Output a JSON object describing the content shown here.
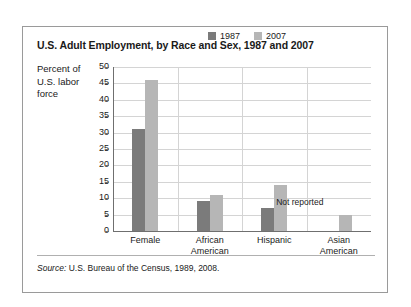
{
  "figure": {
    "title": "U.S. Adult Employment, by Race and Sex, 1987 and 2007",
    "axis_title": "Percent of U.S. labor force",
    "source_label": "Source:",
    "source_text": " U.S. Bureau of the Census, 1989, 2008.",
    "not_reported_label": "Not reported",
    "colors": {
      "series_1987": "#7b7b7b",
      "series_2007": "#b6b6b6",
      "frame_border": "#9a9a9a",
      "gridline": "#d4d4d4",
      "axis": "#6f6f6f",
      "background": "#ffffff"
    }
  },
  "chart_data": {
    "type": "bar",
    "title": "U.S. Adult Employment, by Race and Sex, 1987 and 2007",
    "subtitle": "",
    "xlabel": "",
    "ylabel": "Percent of U.S. labor force",
    "ylim": [
      0,
      50
    ],
    "yticks": [
      0,
      5,
      10,
      15,
      20,
      25,
      30,
      35,
      40,
      45,
      50
    ],
    "ytick_labels": [
      "0",
      "5",
      "10",
      "15",
      "20",
      "25",
      "30",
      "35",
      "40",
      "45",
      "50"
    ],
    "grid": "horizontal",
    "legend_position": "top-center",
    "categories": [
      "Female",
      "African American",
      "Hispanic",
      "Asian American"
    ],
    "category_lines": [
      [
        "Female"
      ],
      [
        "African",
        "American"
      ],
      [
        "Hispanic"
      ],
      [
        "Asian",
        "American"
      ]
    ],
    "series": [
      {
        "name": "1987",
        "color": "#7b7b7b",
        "values": [
          31,
          9,
          7,
          null
        ],
        "value_notes": [
          null,
          null,
          null,
          "Not reported"
        ]
      },
      {
        "name": "2007",
        "color": "#b6b6b6",
        "values": [
          46,
          11,
          14,
          5
        ],
        "value_notes": [
          null,
          null,
          null,
          null
        ]
      }
    ],
    "annotations": [
      {
        "text": "Not reported",
        "category": "Asian American",
        "series": "1987"
      }
    ]
  }
}
